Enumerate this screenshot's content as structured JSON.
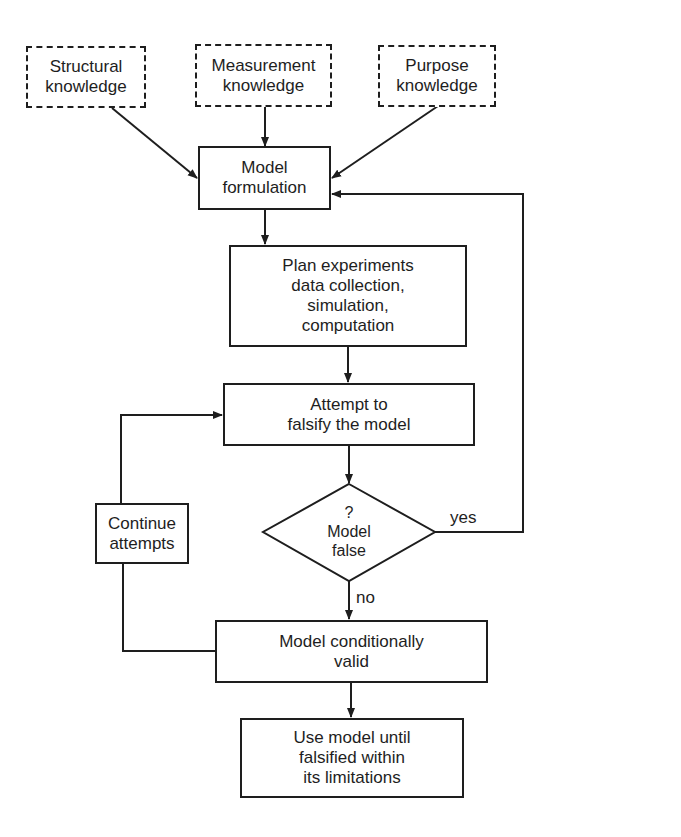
{
  "diagram": {
    "type": "flowchart",
    "nodes": {
      "structural": {
        "text": "Structural\nknowledge",
        "style": "dashed"
      },
      "measurement": {
        "text": "Measurement\nknowledge",
        "style": "dashed"
      },
      "purpose": {
        "text": "Purpose\nknowledge",
        "style": "dashed"
      },
      "formulation": {
        "text": "Model\nformulation",
        "style": "solid"
      },
      "plan": {
        "text": "Plan experiments\ndata collection,\nsimulation,\ncomputation",
        "style": "solid"
      },
      "attempt": {
        "text": "Attempt to\nfalsify the model",
        "style": "solid"
      },
      "decision": {
        "text": "?\nModel\nfalse",
        "style": "diamond"
      },
      "continue": {
        "text": "Continue\nattempts",
        "style": "solid"
      },
      "valid": {
        "text": "Model conditionally\nvalid",
        "style": "solid"
      },
      "use": {
        "text": "Use model until\nfalsified within\nits limitations",
        "style": "solid"
      }
    },
    "edge_labels": {
      "yes": "yes",
      "no": "no"
    },
    "edges": [
      {
        "from": "structural",
        "to": "formulation"
      },
      {
        "from": "measurement",
        "to": "formulation"
      },
      {
        "from": "purpose",
        "to": "formulation"
      },
      {
        "from": "formulation",
        "to": "plan"
      },
      {
        "from": "plan",
        "to": "attempt"
      },
      {
        "from": "attempt",
        "to": "decision"
      },
      {
        "from": "decision",
        "to": "formulation",
        "label": "yes"
      },
      {
        "from": "decision",
        "to": "valid",
        "label": "no"
      },
      {
        "from": "valid",
        "to": "continue"
      },
      {
        "from": "continue",
        "to": "attempt"
      },
      {
        "from": "valid",
        "to": "use"
      }
    ],
    "colors": {
      "stroke": "#1e1e1e",
      "background": "#ffffff"
    }
  }
}
